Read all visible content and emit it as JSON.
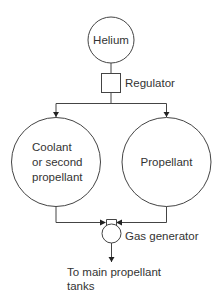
{
  "diagram": {
    "type": "flow",
    "nodes": {
      "helium": {
        "label": "Helium",
        "shape": "circle"
      },
      "regulator": {
        "label": "Regulator",
        "shape": "square"
      },
      "coolant_tank": {
        "label_lines": [
          "Coolant",
          "or second",
          "propellant"
        ],
        "shape": "circle"
      },
      "propellant_tank": {
        "label": "Propellant",
        "shape": "circle"
      },
      "gas_generator": {
        "label": "Gas generator",
        "shape": "generator"
      },
      "output": {
        "label_lines": [
          "To main propellant",
          "tanks"
        ]
      }
    },
    "edges": [
      {
        "from": "helium",
        "to": "regulator"
      },
      {
        "from": "regulator",
        "to": "coolant_tank"
      },
      {
        "from": "regulator",
        "to": "propellant_tank"
      },
      {
        "from": "coolant_tank",
        "to": "gas_generator"
      },
      {
        "from": "propellant_tank",
        "to": "gas_generator"
      },
      {
        "from": "gas_generator",
        "to": "output"
      }
    ],
    "colors": {
      "stroke": "#444444",
      "text": "#333333",
      "background": "#ffffff"
    }
  }
}
